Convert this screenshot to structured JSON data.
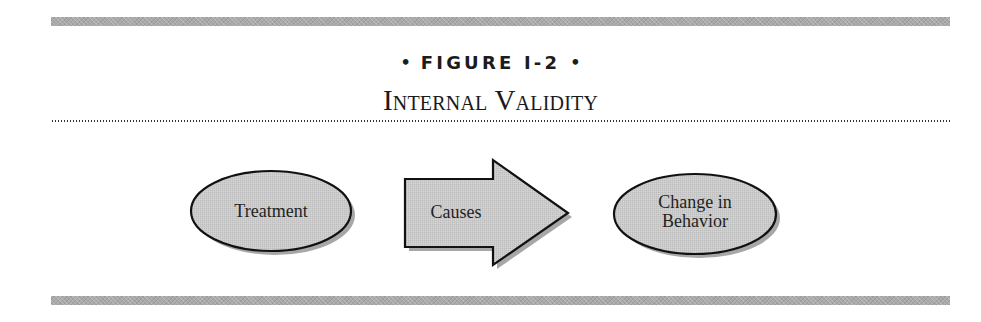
{
  "figure": {
    "bullet_left": "•",
    "label": "FIGURE I-2",
    "bullet_right": "•",
    "title": "Internal Validity"
  },
  "diagram": {
    "nodes": [
      {
        "id": "treatment",
        "shape": "ellipse",
        "label": "Treatment"
      },
      {
        "id": "causes",
        "shape": "block-arrow",
        "label": "Causes"
      },
      {
        "id": "change",
        "shape": "ellipse",
        "label_lines": [
          "Change in",
          "Behavior"
        ]
      }
    ],
    "flow": [
      "Treatment",
      "Causes",
      "Change in Behavior"
    ]
  },
  "colors": {
    "rule_bar": "#a9a9a9",
    "shape_fill": "#c9c9c9",
    "shape_stroke": "#111111",
    "shadow": "#8a8a8a",
    "text": "#1a1a1a"
  }
}
